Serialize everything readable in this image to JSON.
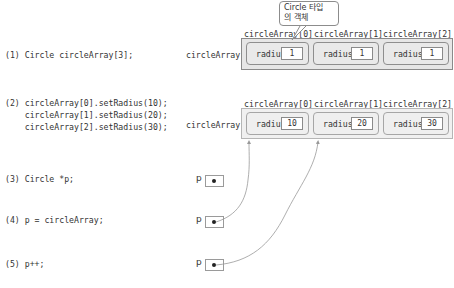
{
  "steps": [
    {
      "id": 1,
      "code": [
        "(1) Circle circleArray[3];"
      ]
    },
    {
      "id": 2,
      "code": [
        "(2) circleArray[0].setRadius(10);",
        "    circleArray[1].setRadius(20);",
        "    circleArray[2].setRadius(30);"
      ]
    },
    {
      "id": 3,
      "code": [
        "(3) Circle *p;"
      ]
    },
    {
      "id": 4,
      "code": [
        "(4) p = circleArray;"
      ]
    },
    {
      "id": 5,
      "code": [
        "(5) p++;"
      ]
    }
  ],
  "callout": {
    "line1": "Circle 타입",
    "line2": "의 객체"
  },
  "array_name": "circleArray",
  "index_labels": [
    "circleArray[0]",
    "circleArray[1]",
    "circleArray[2]"
  ],
  "field_name": "radius",
  "array_state_1": {
    "values": [
      "1",
      "1",
      "1"
    ]
  },
  "array_state_2": {
    "values": [
      "10",
      "20",
      "30"
    ]
  },
  "pointer_label": "p",
  "pointers": [
    {
      "step": 3,
      "target": null
    },
    {
      "step": 4,
      "target": "circleArray[0]"
    },
    {
      "step": 5,
      "target": "circleArray[1]"
    }
  ],
  "colors": {
    "box_border": "#8a8a8a",
    "box_fill": "#e6e6e6",
    "wire": "#999999"
  }
}
